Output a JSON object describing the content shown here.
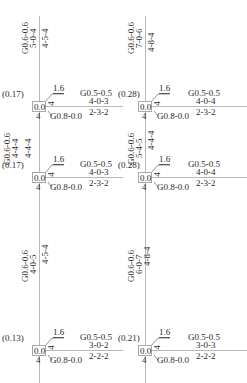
{
  "drawing": {
    "columns": [
      {
        "id": "left",
        "column_top_label": {
          "g": "G0.6-0.6",
          "a": "5-0-4",
          "b": "4-5-4"
        },
        "column_mid_label": {
          "g": "G0.6-0.6",
          "a": "4-4-4",
          "b": "4-4-4"
        },
        "column_bot_label": {
          "g": "G0.6-0.6",
          "a": "4-0-5",
          "b": "4-5-4"
        }
      },
      {
        "id": "right",
        "column_top_label": {
          "g": "G0.6-0.6",
          "a": "7-0-6",
          "b": "4-8-4"
        },
        "column_mid_label": {
          "g": "G0.6-0.6",
          "a": "5-4-5",
          "b": "4-4-4"
        },
        "column_bot_label": {
          "g": "G0.6-0.6",
          "a": "6-0-7",
          "b": "4-8-4"
        }
      }
    ],
    "joints": [
      {
        "ratio": "(0.17)",
        "node": "0.0",
        "top": "1.6",
        "side": "4",
        "below": "4",
        "beam_g": "G0.5-0.5",
        "beam_top": "4-0-3",
        "beam_bot": "2-3-2",
        "lower_g": "G0.8-0.0"
      },
      {
        "ratio": "(0.28)",
        "node": "0.0",
        "top": "1.6",
        "side": "4",
        "below": "4",
        "beam_g": "G0.5-0.5",
        "beam_top": "4-0-4",
        "beam_bot": "2-3-2",
        "lower_g": "G0.8-0.0"
      },
      {
        "ratio": "(0.17)",
        "node": "0.0",
        "top": "1.6",
        "side": "4",
        "below": "4",
        "beam_g": "G0.5-0.5",
        "beam_top": "4-0-3",
        "beam_bot": "2-3-2",
        "lower_g": "G0.8-0.0"
      },
      {
        "ratio": "(0.28)",
        "node": "0.0",
        "top": "1.6",
        "side": "4",
        "below": "4",
        "beam_g": "G0.5-0.5",
        "beam_top": "4-0-4",
        "beam_bot": "2-3-2",
        "lower_g": "G0.8-0.0"
      },
      {
        "ratio": "(0.13)",
        "node": "0.0",
        "top": "1.6",
        "side": "4",
        "below": "4",
        "beam_g": "G0.5-0.5",
        "beam_top": "3-0-2",
        "beam_bot": "2-2-2",
        "lower_g": "G0.8-0.0"
      },
      {
        "ratio": "(0.21)",
        "node": "0.0",
        "top": "1.6",
        "side": "4",
        "below": "4",
        "beam_g": "G0.5-0.5",
        "beam_top": "3-0-3",
        "beam_bot": "2-2-2",
        "lower_g": "G0.8-0.0"
      }
    ]
  }
}
